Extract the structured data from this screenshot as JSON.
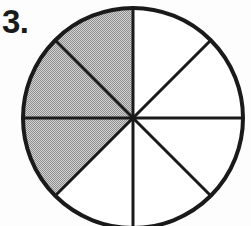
{
  "page": {
    "background_color": "#fdfdfd",
    "width": 251,
    "height": 226
  },
  "problem": {
    "number_label": "3.",
    "figure_name": "fraction-circle"
  },
  "chart_data": {
    "type": "pie",
    "title": "",
    "subtitle": "",
    "xlabel": "",
    "ylabel": "",
    "legend_position": "none",
    "grid": false,
    "total_sectors": 8,
    "shaded_sectors": 3,
    "unshaded_sectors": 5,
    "fraction_shaded": "3/8",
    "sector_angle_degrees": 45,
    "categories": [
      "shaded",
      "unshaded"
    ],
    "values": [
      3,
      5
    ],
    "sectors": [
      {
        "index": 1,
        "start_deg": 0,
        "end_deg": 45,
        "shaded": false,
        "fill": "#ffffff"
      },
      {
        "index": 2,
        "start_deg": 45,
        "end_deg": 90,
        "shaded": false,
        "fill": "#ffffff"
      },
      {
        "index": 3,
        "start_deg": 90,
        "end_deg": 135,
        "shaded": true,
        "fill": "#b9b9b9"
      },
      {
        "index": 4,
        "start_deg": 135,
        "end_deg": 180,
        "shaded": true,
        "fill": "#b9b9b9"
      },
      {
        "index": 5,
        "start_deg": 180,
        "end_deg": 225,
        "shaded": true,
        "fill": "#b9b9b9"
      },
      {
        "index": 6,
        "start_deg": 225,
        "end_deg": 270,
        "shaded": false,
        "fill": "#ffffff"
      },
      {
        "index": 7,
        "start_deg": 270,
        "end_deg": 315,
        "shaded": false,
        "fill": "#ffffff"
      },
      {
        "index": 8,
        "start_deg": 315,
        "end_deg": 360,
        "shaded": false,
        "fill": "#ffffff"
      }
    ],
    "geometry": {
      "center_x": 133,
      "center_y": 118,
      "radius": 110,
      "outline_width": 4,
      "divider_width": 3
    },
    "colors": {
      "outline": "#1a1a1a",
      "divider": "#1a1a1a",
      "shaded_fill": "#b9b9b9",
      "unshaded_fill": "#ffffff",
      "label": "#1a1a1a"
    }
  }
}
